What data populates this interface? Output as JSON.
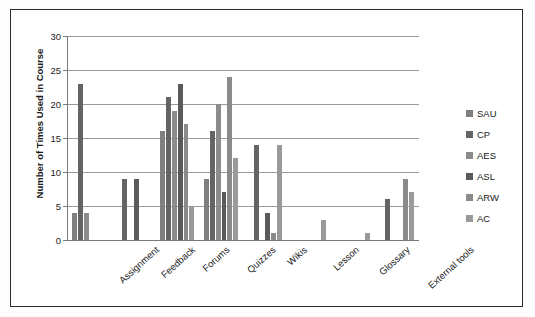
{
  "chart_data": {
    "type": "bar",
    "title": "",
    "subtitle": "",
    "xlabel": "",
    "ylabel": "Number of Times Used in Course",
    "ylim": [
      0,
      30
    ],
    "ytick_step": 5,
    "yticks": [
      0,
      5,
      10,
      15,
      20,
      25,
      30
    ],
    "grid": "horizontal",
    "legend_position": "right",
    "categories": [
      "Assignment",
      "Feedback",
      "Forums",
      "Quizzes",
      "Wikis",
      "Lesson",
      "Glossary",
      "External tools"
    ],
    "series": [
      {
        "name": "SAU",
        "color": "#7f7f7f",
        "values": [
          4,
          0,
          16,
          9,
          0,
          0,
          0,
          0
        ]
      },
      {
        "name": "CP",
        "color": "#646464",
        "values": [
          23,
          9,
          21,
          16,
          14,
          0,
          0,
          6
        ]
      },
      {
        "name": "AES",
        "color": "#8c8c8c",
        "values": [
          4,
          0,
          19,
          20,
          0,
          0,
          0,
          0
        ]
      },
      {
        "name": "ASL",
        "color": "#5a5a5a",
        "values": [
          0,
          9,
          23,
          7,
          4,
          0,
          0,
          0
        ]
      },
      {
        "name": "ARW",
        "color": "#8a8a8a",
        "values": [
          0,
          0,
          17,
          24,
          1,
          0,
          0,
          9
        ]
      },
      {
        "name": "AC",
        "color": "#9a9a9a",
        "values": [
          0,
          0,
          5,
          12,
          14,
          3,
          1,
          7
        ]
      }
    ]
  },
  "legend": {
    "items": [
      {
        "label": "SAU"
      },
      {
        "label": "CP"
      },
      {
        "label": "AES"
      },
      {
        "label": "ASL"
      },
      {
        "label": "ARW"
      },
      {
        "label": "AC"
      }
    ]
  }
}
